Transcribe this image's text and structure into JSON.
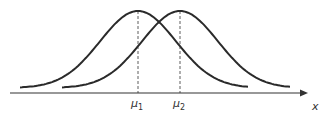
{
  "diagram": {
    "type": "two-overlapping-normal-distributions",
    "curves": [
      {
        "name": "distribution-1",
        "mean_label": "μ1",
        "peak_x": 138
      },
      {
        "name": "distribution-2",
        "mean_label": "μ2",
        "peak_x": 180
      }
    ],
    "axis_label": "x",
    "labels": {
      "mu1": {
        "sym": "μ",
        "sub": "1"
      },
      "mu2": {
        "sym": "μ",
        "sub": "2"
      },
      "x": "x"
    },
    "colors": {
      "stroke": "#2a2a2a"
    }
  }
}
